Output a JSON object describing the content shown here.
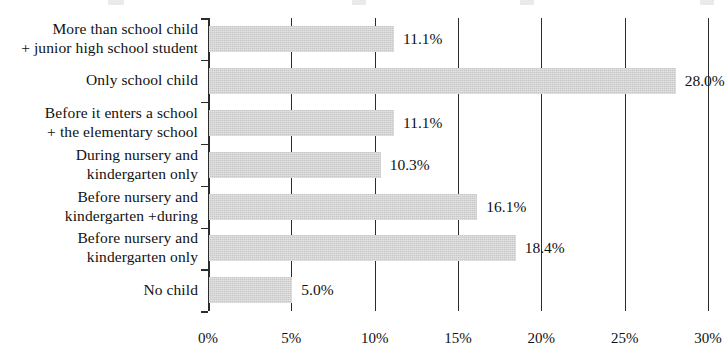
{
  "chart_data": {
    "type": "bar",
    "orientation": "horizontal",
    "title": "",
    "xlabel": "",
    "ylabel": "",
    "xlim": [
      0,
      30
    ],
    "grid": true,
    "legend": "none",
    "value_suffix": "%",
    "bar_color": "#c9c9c9",
    "axis_color": "#2b2b2b",
    "categories": [
      "More than school child + junior high school student",
      "Only school child",
      "Before it enters a school + the elementary school",
      "During nursery and kindergarten only",
      "Before nursery and kindergarten +during",
      "Before nursery and kindergarten only",
      "No child"
    ],
    "category_lines": [
      [
        "More than school child",
        "+ junior high school student"
      ],
      [
        "Only school child",
        ""
      ],
      [
        "Before it enters a school",
        "+ the elementary school"
      ],
      [
        "During nursery and",
        "kindergarten only"
      ],
      [
        "Before nursery and",
        "kindergarten +during"
      ],
      [
        "Before nursery and",
        "kindergarten only"
      ],
      [
        "No child",
        ""
      ]
    ],
    "values": [
      11.1,
      28.0,
      11.1,
      10.3,
      16.1,
      18.4,
      5.0
    ],
    "value_labels": [
      "11.1%",
      "28.0%",
      "11.1%",
      "10.3%",
      "16.1%",
      "18.4%",
      "5.0%"
    ],
    "xticks": [
      0,
      5,
      10,
      15,
      20,
      25,
      30
    ],
    "xticklabels": [
      "0%",
      "5%",
      "10%",
      "15%",
      "20%",
      "25%",
      "30%"
    ]
  }
}
